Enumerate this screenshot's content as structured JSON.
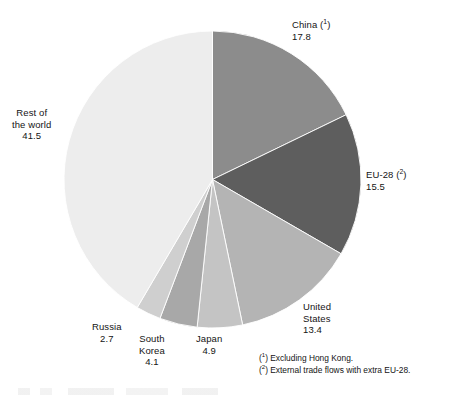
{
  "chart_data": {
    "type": "pie",
    "title": "",
    "subtitle": "",
    "xlabel": "",
    "ylabel": "",
    "legend_position": "none",
    "grid": false,
    "start_angle_deg": 0,
    "direction": "clockwise",
    "units": "%",
    "total": 99.9,
    "categories": [
      "China (¹)",
      "EU-28 (²)",
      "United States",
      "Japan",
      "South Korea",
      "Russia",
      "Rest of the world"
    ],
    "values": [
      17.8,
      15.5,
      13.4,
      4.9,
      4.1,
      2.7,
      41.5
    ],
    "colors": [
      "#8c8c8c",
      "#5e5e5e",
      "#b4b4b4",
      "#c4c4c4",
      "#a8a8a8",
      "#cfcfcf",
      "#ededed"
    ],
    "slices": [
      {
        "key": "china",
        "name": "China",
        "footnote_marker": "1",
        "label_line1": "China",
        "value": 17.8,
        "value_text": "17.8",
        "color": "#8c8c8c"
      },
      {
        "key": "eu28",
        "name": "EU-28",
        "footnote_marker": "2",
        "label_line1": "EU-28",
        "value": 15.5,
        "value_text": "15.5",
        "color": "#5e5e5e"
      },
      {
        "key": "united-states",
        "name": "United States",
        "footnote_marker": "",
        "label_line1": "United",
        "label_line2": "States",
        "value": 13.4,
        "value_text": "13.4",
        "color": "#b4b4b4"
      },
      {
        "key": "japan",
        "name": "Japan",
        "footnote_marker": "",
        "label_line1": "Japan",
        "value": 4.9,
        "value_text": "4.9",
        "color": "#c4c4c4"
      },
      {
        "key": "south-korea",
        "name": "South Korea",
        "footnote_marker": "",
        "label_line1": "South",
        "label_line2": "Korea",
        "value": 4.1,
        "value_text": "4.1",
        "color": "#a8a8a8"
      },
      {
        "key": "russia",
        "name": "Russia",
        "footnote_marker": "",
        "label_line1": "Russia",
        "value": 2.7,
        "value_text": "2.7",
        "color": "#cfcfcf"
      },
      {
        "key": "rest-of-the-world",
        "name": "Rest of the world",
        "footnote_marker": "",
        "label_line1": "Rest of",
        "label_line2": "the world",
        "value": 41.5,
        "value_text": "41.5",
        "color": "#ededed"
      }
    ],
    "annotations": [
      "(¹) Excluding Hong Kong.",
      "(²) External trade flows with extra EU-28."
    ]
  },
  "footnotes": {
    "marker1": "1",
    "marker2": "2",
    "text1": ") Excluding Hong Kong.",
    "text2": ") External trade flows with extra EU-28.",
    "open": "("
  },
  "style": {
    "slice_outline": "#ffffff",
    "text_color": "#141414",
    "background": "#ffffff"
  }
}
